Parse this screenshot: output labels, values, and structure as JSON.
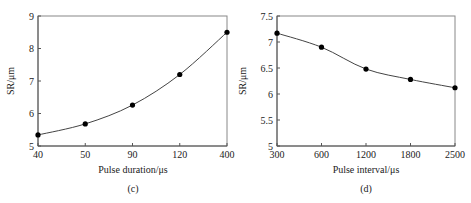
{
  "chart_data": [
    {
      "type": "line",
      "caption": "(c)",
      "title": "",
      "xlabel": "Pulse duration/μs",
      "ylabel": "SR/μm",
      "categories": [
        "40",
        "50",
        "90",
        "120",
        "400"
      ],
      "series": [
        {
          "name": "SR",
          "values": [
            5.34,
            5.68,
            6.26,
            7.2,
            8.5
          ]
        }
      ],
      "ylim": [
        5,
        9
      ],
      "yticks": [
        5,
        6,
        7,
        8,
        9
      ],
      "ytick_labels": [
        "5",
        "6",
        "7",
        "8",
        "9"
      ],
      "grid": false,
      "legend": "none"
    },
    {
      "type": "line",
      "caption": "(d)",
      "title": "",
      "xlabel": "Pulse interval/μs",
      "ylabel": "SR/μm",
      "categories": [
        "300",
        "600",
        "1200",
        "1800",
        "2500"
      ],
      "series": [
        {
          "name": "SR",
          "values": [
            7.17,
            6.9,
            6.48,
            6.28,
            6.12
          ]
        }
      ],
      "ylim": [
        5,
        7.5
      ],
      "yticks": [
        5,
        5.5,
        6,
        6.5,
        7,
        7.5
      ],
      "ytick_labels": [
        "5",
        "5.5",
        "6",
        "6.5",
        "7",
        "7.5"
      ],
      "grid": false,
      "legend": "none"
    }
  ]
}
